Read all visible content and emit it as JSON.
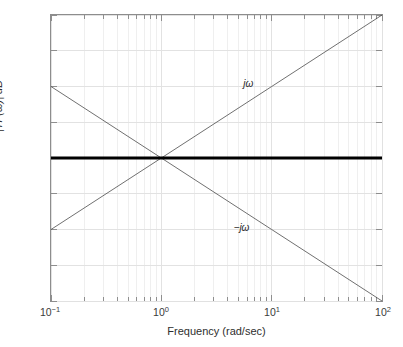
{
  "chart_data": {
    "type": "line",
    "title": "",
    "subtitle": "",
    "xlabel": "Frequency (rad/sec)",
    "ylabel": "|TF(ω)| dB",
    "xscale": "log",
    "yscale": "linear",
    "xlim": [
      0.1,
      100
    ],
    "ylim": [
      -40,
      40
    ],
    "grid": true,
    "minor_grid": true,
    "legend": "none",
    "xticks": [
      {
        "value": 0.1,
        "mantissa": "10",
        "exponent": "-1"
      },
      {
        "value": 1,
        "mantissa": "10",
        "exponent": "0"
      },
      {
        "value": 10,
        "mantissa": "10",
        "exponent": "1"
      },
      {
        "value": 100,
        "mantissa": "10",
        "exponent": "2"
      }
    ],
    "yticks": [
      40,
      30,
      20,
      10,
      0,
      -10,
      -20,
      -30,
      -40
    ],
    "ytick_labels": [
      "40",
      "30",
      "20",
      "10",
      "0",
      "−10",
      "−20",
      "−30",
      "−40"
    ],
    "series": [
      {
        "name": "jω",
        "annotation": "jω",
        "annotation_x": 6.0,
        "annotation_y": 21.0,
        "slope_db_per_decade": 20,
        "color": "#4a4a4a",
        "width": 0.8,
        "x": [
          0.1,
          1,
          10,
          100
        ],
        "y": [
          -20,
          0,
          20,
          40
        ]
      },
      {
        "name": "-jω",
        "annotation": "−jω",
        "annotation_x": 5.2,
        "annotation_y": -19.0,
        "slope_db_per_decade": -20,
        "color": "#4a4a4a",
        "width": 0.8,
        "x": [
          0.1,
          1,
          10,
          100
        ],
        "y": [
          20,
          0,
          -20,
          -40
        ]
      },
      {
        "name": "0 dB",
        "annotation": "",
        "slope_db_per_decade": 0,
        "color": "#000000",
        "width": 3.2,
        "x": [
          0.1,
          100
        ],
        "y": [
          0,
          0
        ]
      }
    ],
    "colors": {
      "background": "#ffffff",
      "axis": "#8d8d8d",
      "grid_major": "#e2e2e2",
      "grid_minor": "#efefef",
      "text": "#333333",
      "line_thick": "#000000",
      "line_thin": "#4a4a4a"
    }
  }
}
